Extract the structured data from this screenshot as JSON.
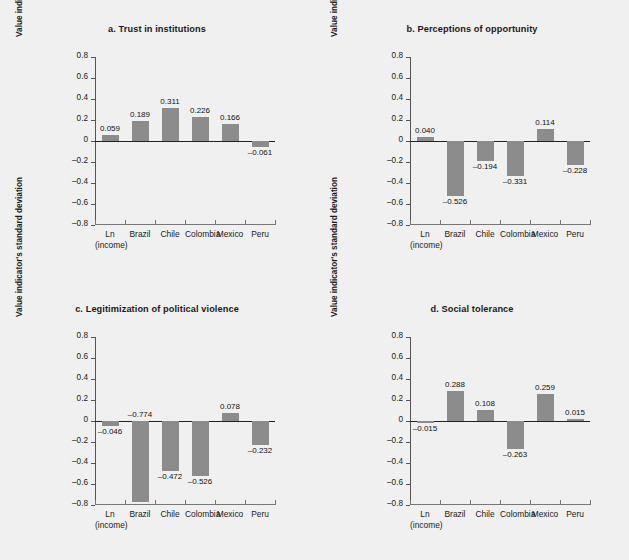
{
  "figure": {
    "background_color": "#f0f0f0",
    "bar_color": "#8c8c8c",
    "axis_color": "#222222"
  },
  "chart_data": [
    {
      "type": "bar",
      "panel_id": "a",
      "title": "a.  Trust in institutions",
      "xlabel": "",
      "ylabel": "Value indicator's standard deviation",
      "ylim": [
        -0.8,
        0.8
      ],
      "yticks": [
        "0.8",
        "0.6",
        "0.4",
        "0.2",
        "0",
        "–0.2",
        "–0.4",
        "–0.6",
        "–0.8"
      ],
      "ytick_values": [
        0.8,
        0.6,
        0.4,
        0.2,
        0,
        -0.2,
        -0.4,
        -0.6,
        -0.8
      ],
      "grid": false,
      "legend": null,
      "categories": [
        "Ln\n(income)",
        "Brazil",
        "Chile",
        "Colombia",
        "Mexico",
        "Peru"
      ],
      "category_labels": [
        {
          "line1": "Ln",
          "line2": "(income)"
        },
        {
          "line1": "Brazil",
          "line2": ""
        },
        {
          "line1": "Chile",
          "line2": ""
        },
        {
          "line1": "Colombia",
          "line2": ""
        },
        {
          "line1": "Mexico",
          "line2": ""
        },
        {
          "line1": "Peru",
          "line2": ""
        }
      ],
      "values": [
        0.059,
        0.189,
        0.311,
        0.226,
        0.166,
        -0.061
      ],
      "value_labels": [
        "0.059",
        "0.189",
        "0.311",
        "0.226",
        "0.166",
        "–0.061"
      ]
    },
    {
      "type": "bar",
      "panel_id": "b",
      "title": "b.  Perceptions of opportunity",
      "xlabel": "",
      "ylabel": "Value indicator's standard deviation",
      "ylim": [
        -0.8,
        0.8
      ],
      "yticks": [
        "0.8",
        "0.6",
        "0.4",
        "0.2",
        "0",
        "–0.2",
        "–0.4",
        "–0.6",
        "–0.8"
      ],
      "ytick_values": [
        0.8,
        0.6,
        0.4,
        0.2,
        0,
        -0.2,
        -0.4,
        -0.6,
        -0.8
      ],
      "grid": false,
      "legend": null,
      "categories": [
        "Ln\n(income)",
        "Brazil",
        "Chile",
        "Colombia",
        "Mexico",
        "Peru"
      ],
      "category_labels": [
        {
          "line1": "Ln",
          "line2": "(income)"
        },
        {
          "line1": "Brazil",
          "line2": ""
        },
        {
          "line1": "Chile",
          "line2": ""
        },
        {
          "line1": "Colombia",
          "line2": ""
        },
        {
          "line1": "Mexico",
          "line2": ""
        },
        {
          "line1": "Peru",
          "line2": ""
        }
      ],
      "values": [
        0.04,
        -0.526,
        -0.194,
        -0.331,
        0.114,
        -0.228
      ],
      "value_labels": [
        "0.040",
        "–0.526",
        "–0.194",
        "–0.331",
        "0.114",
        "–0.228"
      ]
    },
    {
      "type": "bar",
      "panel_id": "c",
      "title": "c.  Legitimization of political violence",
      "xlabel": "",
      "ylabel": "Value indicator's standard deviation",
      "ylim": [
        -0.8,
        0.8
      ],
      "yticks": [
        "0.8",
        "0.6",
        "0.4",
        "0.2",
        "0",
        "–0.2",
        "–0.4",
        "–0.6",
        "–0.8"
      ],
      "ytick_values": [
        0.8,
        0.6,
        0.4,
        0.2,
        0,
        -0.2,
        -0.4,
        -0.6,
        -0.8
      ],
      "grid": false,
      "legend": null,
      "categories": [
        "Ln\n(income)",
        "Brazil",
        "Chile",
        "Colombia",
        "Mexico",
        "Peru"
      ],
      "category_labels": [
        {
          "line1": "Ln",
          "line2": "(income)"
        },
        {
          "line1": "Brazil",
          "line2": ""
        },
        {
          "line1": "Chile",
          "line2": ""
        },
        {
          "line1": "Colombia",
          "line2": ""
        },
        {
          "line1": "Mexico",
          "line2": ""
        },
        {
          "line1": "Peru",
          "line2": ""
        }
      ],
      "values": [
        -0.046,
        -0.774,
        -0.472,
        -0.526,
        0.078,
        -0.232
      ],
      "value_labels": [
        "–0.046",
        "–0.774",
        "–0.472",
        "–0.526",
        "0.078",
        "–0.232"
      ]
    },
    {
      "type": "bar",
      "panel_id": "d",
      "title": "d.  Social tolerance",
      "xlabel": "",
      "ylabel": "Value indicator's standard deviation",
      "ylim": [
        -0.8,
        0.8
      ],
      "yticks": [
        "0.8",
        "0.6",
        "0.4",
        "0.2",
        "0",
        "–0.2",
        "–0.4",
        "–0.6",
        "–0.8"
      ],
      "ytick_values": [
        0.8,
        0.6,
        0.4,
        0.2,
        0,
        -0.2,
        -0.4,
        -0.6,
        -0.8
      ],
      "grid": false,
      "legend": null,
      "categories": [
        "Ln\n(income)",
        "Brazil",
        "Chile",
        "Colombia",
        "Mexico",
        "Peru"
      ],
      "category_labels": [
        {
          "line1": "Ln",
          "line2": "(income)"
        },
        {
          "line1": "Brazil",
          "line2": ""
        },
        {
          "line1": "Chile",
          "line2": ""
        },
        {
          "line1": "Colombia",
          "line2": ""
        },
        {
          "line1": "Mexico",
          "line2": ""
        },
        {
          "line1": "Peru",
          "line2": ""
        }
      ],
      "values": [
        -0.015,
        0.288,
        0.108,
        -0.263,
        0.259,
        0.015
      ],
      "value_labels": [
        "–0.015",
        "0.288",
        "0.108",
        "–0.263",
        "0.259",
        "0.015"
      ]
    }
  ]
}
